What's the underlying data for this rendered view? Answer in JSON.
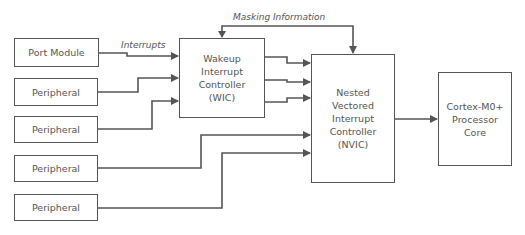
{
  "diagram": {
    "labels": {
      "interrupts": "Interrupts",
      "masking": "Masking Information"
    },
    "sources": [
      {
        "id": "port-module",
        "label": "Port Module"
      },
      {
        "id": "peripheral-1",
        "label": "Peripheral"
      },
      {
        "id": "peripheral-2",
        "label": "Peripheral"
      },
      {
        "id": "peripheral-3",
        "label": "Peripheral"
      },
      {
        "id": "peripheral-4",
        "label": "Peripheral"
      }
    ],
    "wic": {
      "lines": [
        "Wakeup",
        "Interrupt",
        "Controller",
        "(WIC)"
      ]
    },
    "nvic": {
      "lines": [
        "Nested",
        "Vectored",
        "Interrupt",
        "Controller",
        "(NVIC)"
      ]
    },
    "core": {
      "lines": [
        "Cortex-M0+",
        "Processor",
        "Core"
      ]
    },
    "line_color": "#555555"
  }
}
